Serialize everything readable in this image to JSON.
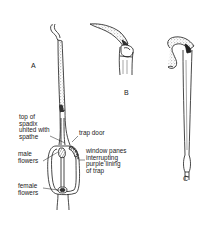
{
  "figure_labels": {
    "a": "A",
    "b": "B",
    "c": "C"
  },
  "annotations": {
    "top_of_spadix": "top of\nspadix\nunited with\nspathe",
    "trap_door": "trap door",
    "male_flowers": "male\nflowers",
    "window_panes": "window panes\ninterrupting\npurple lining\nof trap",
    "female_flowers": "female\nflowers"
  },
  "colors": {
    "ink": "#1a1a1a",
    "background": "#ffffff",
    "stipple": "#6a6a6a"
  }
}
